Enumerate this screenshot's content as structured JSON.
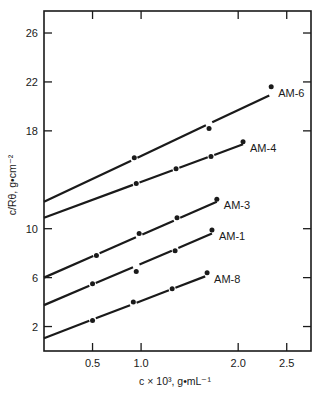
{
  "chart_data": {
    "type": "line",
    "title": "",
    "xlabel": "c × 10³, g•mL⁻¹",
    "ylabel": "c/Rθ, g•cm⁻²",
    "xlim": [
      0,
      2.75
    ],
    "ylim": [
      0,
      27.8
    ],
    "x_ticks": [
      0.5,
      1.0,
      2.0,
      2.5
    ],
    "x_tick_labels": [
      "0.5",
      "1.0",
      "2.0",
      "2.5"
    ],
    "y_ticks": [
      2,
      6,
      10,
      18,
      22,
      26
    ],
    "y_tick_labels": [
      "2",
      "6",
      "10",
      "18",
      "22",
      "26"
    ],
    "grid": false,
    "legend_position": "inline labels at right end of each line",
    "series": [
      {
        "name": "AM-6",
        "intercept": 12.2,
        "fit_end": [
          2.32,
          20.9
        ],
        "points": [
          [
            0.93,
            15.8
          ],
          [
            1.7,
            18.2
          ],
          [
            2.34,
            21.6
          ]
        ]
      },
      {
        "name": "AM-4",
        "intercept": 10.9,
        "fit_end": [
          2.05,
          16.9
        ],
        "points": [
          [
            0.95,
            13.7
          ],
          [
            1.36,
            14.9
          ],
          [
            1.72,
            15.9
          ],
          [
            2.05,
            17.1
          ]
        ]
      },
      {
        "name": "AM-3",
        "intercept": 6.0,
        "fit_end": [
          1.78,
          12.2
        ],
        "points": [
          [
            0.54,
            7.8
          ],
          [
            0.98,
            9.6
          ],
          [
            1.37,
            10.9
          ],
          [
            1.78,
            12.4
          ]
        ]
      },
      {
        "name": "AM-1",
        "intercept": 3.75,
        "fit_end": [
          1.73,
          9.6
        ],
        "points": [
          [
            0.5,
            5.5
          ],
          [
            0.95,
            6.5
          ],
          [
            1.35,
            8.2
          ],
          [
            1.73,
            9.9
          ]
        ]
      },
      {
        "name": "AM-8",
        "intercept": 1.05,
        "fit_end": [
          1.66,
          6.1
        ],
        "points": [
          [
            0.5,
            2.5
          ],
          [
            0.92,
            4.0
          ],
          [
            1.32,
            5.1
          ],
          [
            1.68,
            6.4
          ]
        ]
      }
    ]
  },
  "colors": {
    "ink": "#1a1a1a",
    "background": "#ffffff"
  }
}
